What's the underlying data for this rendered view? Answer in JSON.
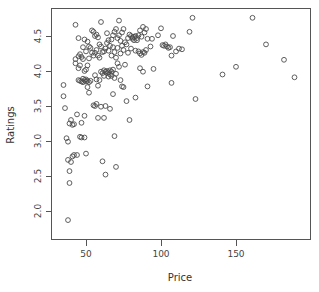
{
  "chart_data": {
    "type": "scatter",
    "title": "",
    "xlabel": "Price",
    "ylabel": "Ratings",
    "xlim": [
      30,
      192
    ],
    "ylim": [
      1.82,
      4.78
    ],
    "xticks": [
      50,
      100,
      150
    ],
    "xtick_labels": [
      "50",
      "100",
      "150"
    ],
    "yticks": [
      2.0,
      2.5,
      3.0,
      3.5,
      4.0,
      4.5
    ],
    "ytick_labels": [
      "2.0",
      "2.5",
      "3.0",
      "3.5",
      "4.0",
      "4.5"
    ],
    "grid": false,
    "legend": null,
    "marker": "open-circle",
    "marker_color": "#4d4d4d",
    "point_count": 170,
    "points": [
      [
        38,
        1.87
      ],
      [
        35,
        3.64
      ],
      [
        35,
        3.8
      ],
      [
        36,
        3.47
      ],
      [
        37,
        3.04
      ],
      [
        38,
        2.99
      ],
      [
        38,
        2.73
      ],
      [
        39,
        2.57
      ],
      [
        39,
        2.4
      ],
      [
        39,
        3.25
      ],
      [
        40,
        2.7
      ],
      [
        40,
        3.3
      ],
      [
        41,
        2.78
      ],
      [
        41,
        3.23
      ],
      [
        42,
        2.8
      ],
      [
        42,
        3.24
      ],
      [
        43,
        4.66
      ],
      [
        43,
        4.11
      ],
      [
        43,
        4.17
      ],
      [
        44,
        3.38
      ],
      [
        44,
        2.8
      ],
      [
        45,
        4.47
      ],
      [
        45,
        4.21
      ],
      [
        45,
        4.04
      ],
      [
        45,
        3.87
      ],
      [
        46,
        4.24
      ],
      [
        46,
        4.08
      ],
      [
        46,
        3.86
      ],
      [
        46,
        3.06
      ],
      [
        47,
        4.2
      ],
      [
        47,
        3.85
      ],
      [
        47,
        3.26
      ],
      [
        47,
        3.05
      ],
      [
        48,
        4.34
      ],
      [
        48,
        4.17
      ],
      [
        48,
        3.89
      ],
      [
        48,
        3.84
      ],
      [
        49,
        4.45
      ],
      [
        49,
        4.0
      ],
      [
        49,
        3.87
      ],
      [
        49,
        3.36
      ],
      [
        49,
        3.05
      ],
      [
        50,
        4.28
      ],
      [
        50,
        4.02
      ],
      [
        50,
        3.88
      ],
      [
        50,
        3.85
      ],
      [
        50,
        2.82
      ],
      [
        51,
        4.42
      ],
      [
        51,
        4.08
      ],
      [
        51,
        3.86
      ],
      [
        51,
        3.77
      ],
      [
        52,
        4.35
      ],
      [
        52,
        4.18
      ],
      [
        52,
        3.84
      ],
      [
        52,
        3.69
      ],
      [
        53,
        4.33
      ],
      [
        53,
        3.86
      ],
      [
        54,
        4.58
      ],
      [
        54,
        4.26
      ],
      [
        55,
        4.56
      ],
      [
        55,
        4.22
      ],
      [
        55,
        3.51
      ],
      [
        56,
        4.5
      ],
      [
        56,
        4.26
      ],
      [
        56,
        3.94
      ],
      [
        56,
        3.5
      ],
      [
        57,
        4.52
      ],
      [
        57,
        4.3
      ],
      [
        57,
        3.88
      ],
      [
        57,
        3.53
      ],
      [
        58,
        4.48
      ],
      [
        58,
        4.22
      ],
      [
        58,
        3.79
      ],
      [
        58,
        3.33
      ],
      [
        59,
        4.38
      ],
      [
        59,
        4.19
      ],
      [
        59,
        3.87
      ],
      [
        60,
        4.7
      ],
      [
        60,
        4.35
      ],
      [
        60,
        3.99
      ],
      [
        60,
        3.49
      ],
      [
        61,
        4.27
      ],
      [
        61,
        3.97
      ],
      [
        61,
        2.71
      ],
      [
        62,
        4.28
      ],
      [
        62,
        4.01
      ],
      [
        62,
        3.93
      ],
      [
        62,
        3.33
      ],
      [
        63,
        4.32
      ],
      [
        63,
        3.99
      ],
      [
        63,
        3.5
      ],
      [
        63,
        2.52
      ],
      [
        64,
        4.54
      ],
      [
        64,
        4.4
      ],
      [
        64,
        4.0
      ],
      [
        64,
        3.97
      ],
      [
        65,
        4.44
      ],
      [
        65,
        4.29
      ],
      [
        65,
        3.98
      ],
      [
        65,
        3.92
      ],
      [
        66,
        4.36
      ],
      [
        66,
        4.01
      ],
      [
        66,
        3.95
      ],
      [
        66,
        3.46
      ],
      [
        67,
        4.45
      ],
      [
        67,
        4.22
      ],
      [
        67,
        3.99
      ],
      [
        67,
        3.93
      ],
      [
        68,
        4.51
      ],
      [
        68,
        4.34
      ],
      [
        68,
        4.02
      ],
      [
        68,
        3.67
      ],
      [
        69,
        4.56
      ],
      [
        69,
        4.27
      ],
      [
        69,
        3.9
      ],
      [
        69,
        3.07
      ],
      [
        70,
        4.6
      ],
      [
        70,
        4.19
      ],
      [
        70,
        3.96
      ],
      [
        70,
        2.63
      ],
      [
        71,
        4.47
      ],
      [
        71,
        4.33
      ],
      [
        71,
        4.11
      ],
      [
        72,
        4.72
      ],
      [
        72,
        4.51
      ],
      [
        72,
        4.06
      ],
      [
        73,
        4.43
      ],
      [
        73,
        4.25
      ],
      [
        73,
        3.87
      ],
      [
        74,
        4.55
      ],
      [
        74,
        4.36
      ],
      [
        74,
        3.78
      ],
      [
        75,
        4.6
      ],
      [
        75,
        4.3
      ],
      [
        75,
        3.77
      ],
      [
        76,
        4.41
      ],
      [
        76,
        4.09
      ],
      [
        77,
        4.38
      ],
      [
        77,
        3.57
      ],
      [
        78,
        4.47
      ],
      [
        78,
        4.26
      ],
      [
        79,
        4.52
      ],
      [
        79,
        3.3
      ],
      [
        80,
        4.5
      ],
      [
        80,
        4.32
      ],
      [
        81,
        4.48
      ],
      [
        81,
        4.46
      ],
      [
        82,
        4.49
      ],
      [
        82,
        4.44
      ],
      [
        83,
        4.5
      ],
      [
        83,
        4.29
      ],
      [
        83,
        3.62
      ],
      [
        84,
        4.47
      ],
      [
        84,
        4.44
      ],
      [
        85,
        4.51
      ],
      [
        85,
        4.28
      ],
      [
        86,
        4.58
      ],
      [
        86,
        4.25
      ],
      [
        86,
        4.04
      ],
      [
        87,
        4.49
      ],
      [
        87,
        4.23
      ],
      [
        88,
        4.63
      ],
      [
        88,
        4.27
      ],
      [
        88,
        3.99
      ],
      [
        89,
        4.55
      ],
      [
        89,
        4.26
      ],
      [
        90,
        4.6
      ],
      [
        90,
        4.3
      ],
      [
        91,
        4.46
      ],
      [
        91,
        3.78
      ],
      [
        93,
        4.35
      ],
      [
        94,
        4.46
      ],
      [
        95,
        4.03
      ],
      [
        98,
        4.51
      ],
      [
        100,
        4.61
      ],
      [
        101,
        4.37
      ],
      [
        102,
        4.36
      ],
      [
        103,
        4.38
      ],
      [
        104,
        4.35
      ],
      [
        105,
        4.33
      ],
      [
        106,
        4.34
      ],
      [
        107,
        4.22
      ],
      [
        107,
        3.83
      ],
      [
        108,
        4.5
      ],
      [
        110,
        4.28
      ],
      [
        112,
        4.32
      ],
      [
        114,
        4.31
      ],
      [
        119,
        4.56
      ],
      [
        121,
        4.76
      ],
      [
        123,
        3.6
      ],
      [
        141,
        3.95
      ],
      [
        150,
        4.06
      ],
      [
        161,
        4.76
      ],
      [
        170,
        4.38
      ],
      [
        182,
        4.16
      ],
      [
        189,
        3.91
      ]
    ]
  },
  "axes": {
    "x_axis_name": "price-axis",
    "y_axis_name": "ratings-axis"
  }
}
